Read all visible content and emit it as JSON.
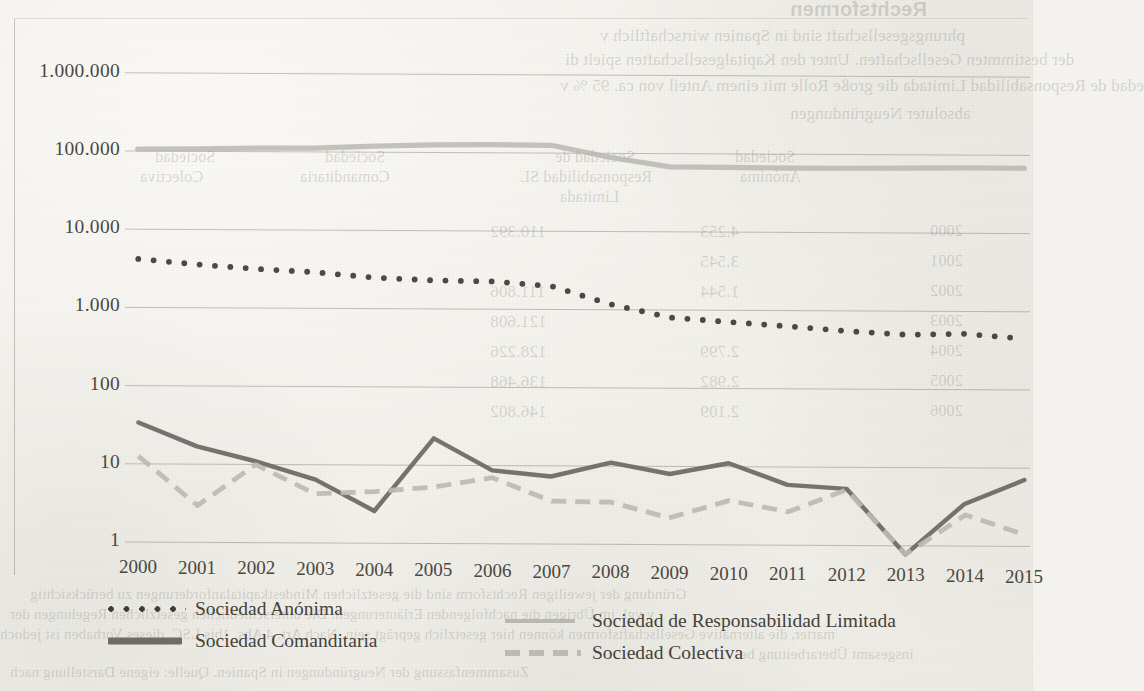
{
  "chart_data": {
    "type": "line",
    "title": "",
    "subtitle": "",
    "xlabel": "",
    "ylabel": "",
    "scale": "log",
    "grid": true,
    "legend_position": "bottom",
    "categories": [
      "2000",
      "2001",
      "2002",
      "2003",
      "2004",
      "2005",
      "2006",
      "2007",
      "2008",
      "2009",
      "2010",
      "2011",
      "2012",
      "2013",
      "2014",
      "2015"
    ],
    "y_ticks": [
      "1",
      "10",
      "100",
      "1.000",
      "10.000",
      "100.000",
      "1.000.000"
    ],
    "y_tick_values": [
      1,
      10,
      100,
      1000,
      10000,
      100000,
      1000000
    ],
    "ylim": [
      1,
      1000000
    ],
    "series": [
      {
        "name": "Sociedad Anónima",
        "style": "dotted",
        "color": "#3e3b36",
        "values": [
          4300,
          3700,
          3250,
          2900,
          2450,
          2300,
          2200,
          1900,
          1150,
          760,
          680,
          600,
          520,
          460,
          470,
          410
        ]
      },
      {
        "name": "Sociedad de Responsabilidad Limitada",
        "style": "solid-light",
        "color": "#b9b7b1",
        "values": [
          108000,
          110000,
          112000,
          114000,
          118000,
          122000,
          126000,
          120000,
          86000,
          64000,
          63000,
          62000,
          62000,
          62000,
          62000,
          62000
        ]
      },
      {
        "name": "Sociedad Comanditaria",
        "style": "solid",
        "color": "#6f6c66",
        "values": [
          35,
          17,
          11,
          6.5,
          2.6,
          22,
          8.5,
          7,
          10.5,
          7.5,
          10.5,
          5.5,
          5,
          0.72,
          3.2,
          6.4
        ]
      },
      {
        "name": "Sociedad Colectiva",
        "style": "dashed",
        "color": "#bcbab4",
        "values": [
          13,
          3.0,
          10,
          4.3,
          4.6,
          5.2,
          6.8,
          3.4,
          3.3,
          2.1,
          3.5,
          2.5,
          4.8,
          0.72,
          2.3,
          1.3
        ]
      }
    ]
  },
  "legend": {
    "items": [
      {
        "label": "Sociedad Anónima",
        "swatch": "dotted-line-swatch"
      },
      {
        "label": "Sociedad de Responsabilidad Limitada",
        "swatch": "light-solid-line-swatch"
      },
      {
        "label": "Sociedad Comanditaria",
        "swatch": "solid-line-swatch"
      },
      {
        "label": "Sociedad Colectiva",
        "swatch": "dashed-line-swatch"
      }
    ]
  },
  "bleed_through": {
    "note": "mirrored show-through text from the reverse page of the scan",
    "lines": [
      "Rechtsformen",
      "phrungsgesellschaft sind in Spanien wirtschaftlich v",
      "der bestimmten Gesellschaften. Unter den Kapitalgesellschaften spielt di",
      "edad de Responsabilidad Limitada die große Rolle mit einem Anteil von ca. 95 % v",
      "absoluter Neugründungen",
      "Sociedad",
      "Anónima",
      "Sociedad de",
      "Responsabilidad SL",
      "Limitada",
      "Sociedad",
      "Comanditaria",
      "Sociedad",
      "Colectiva",
      "2000",
      "2001",
      "2002",
      "2003",
      "2004",
      "2005",
      "2006",
      "4.253",
      "110.392",
      "3.545",
      "1.544",
      "111.806",
      "121.608",
      "2.799",
      "128.226",
      "2.982",
      "136.468",
      "2.109",
      "146.802",
      "Gründung der jeweiligen Rechtsform sind die gesetzlichen Mindestkapitalanforderungen zu berücksichtig",
      "y vgl. im Übrigen die nachfolgenden Erläuterungen. Die unterschiedlichen gesetzlichen Regelungen der",
      "marter, die alternative Gesellschaftsformen können hier gesetzlich geprägt sein. Nach Art. 4 Abs. 1bis LSC, dieses Vorhaben ist jedoch",
      "insgesamt Überarbeitung be",
      "Zusammenfassung der Neugründungen in Spanien. Quelle: eigene Darstellung nach"
    ]
  }
}
